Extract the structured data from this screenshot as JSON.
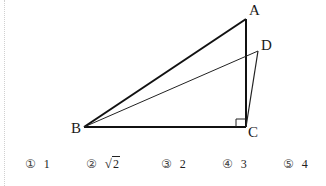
{
  "figure": {
    "points": {
      "A": {
        "label": "A",
        "x": 246,
        "y": 19
      },
      "B": {
        "label": "B",
        "x": 84,
        "y": 127
      },
      "C": {
        "label": "C",
        "x": 246,
        "y": 127
      },
      "D": {
        "label": "D",
        "x": 258,
        "y": 51
      }
    },
    "right_angle_at": "C",
    "segments": [
      "AB",
      "AC",
      "BC",
      "BD",
      "CD"
    ]
  },
  "choices": [
    {
      "num": "①",
      "value": "1"
    },
    {
      "num": "②",
      "value": "2",
      "sqrt": true
    },
    {
      "num": "③",
      "value": "2"
    },
    {
      "num": "④",
      "value": "3"
    },
    {
      "num": "⑤",
      "value": "4"
    }
  ]
}
